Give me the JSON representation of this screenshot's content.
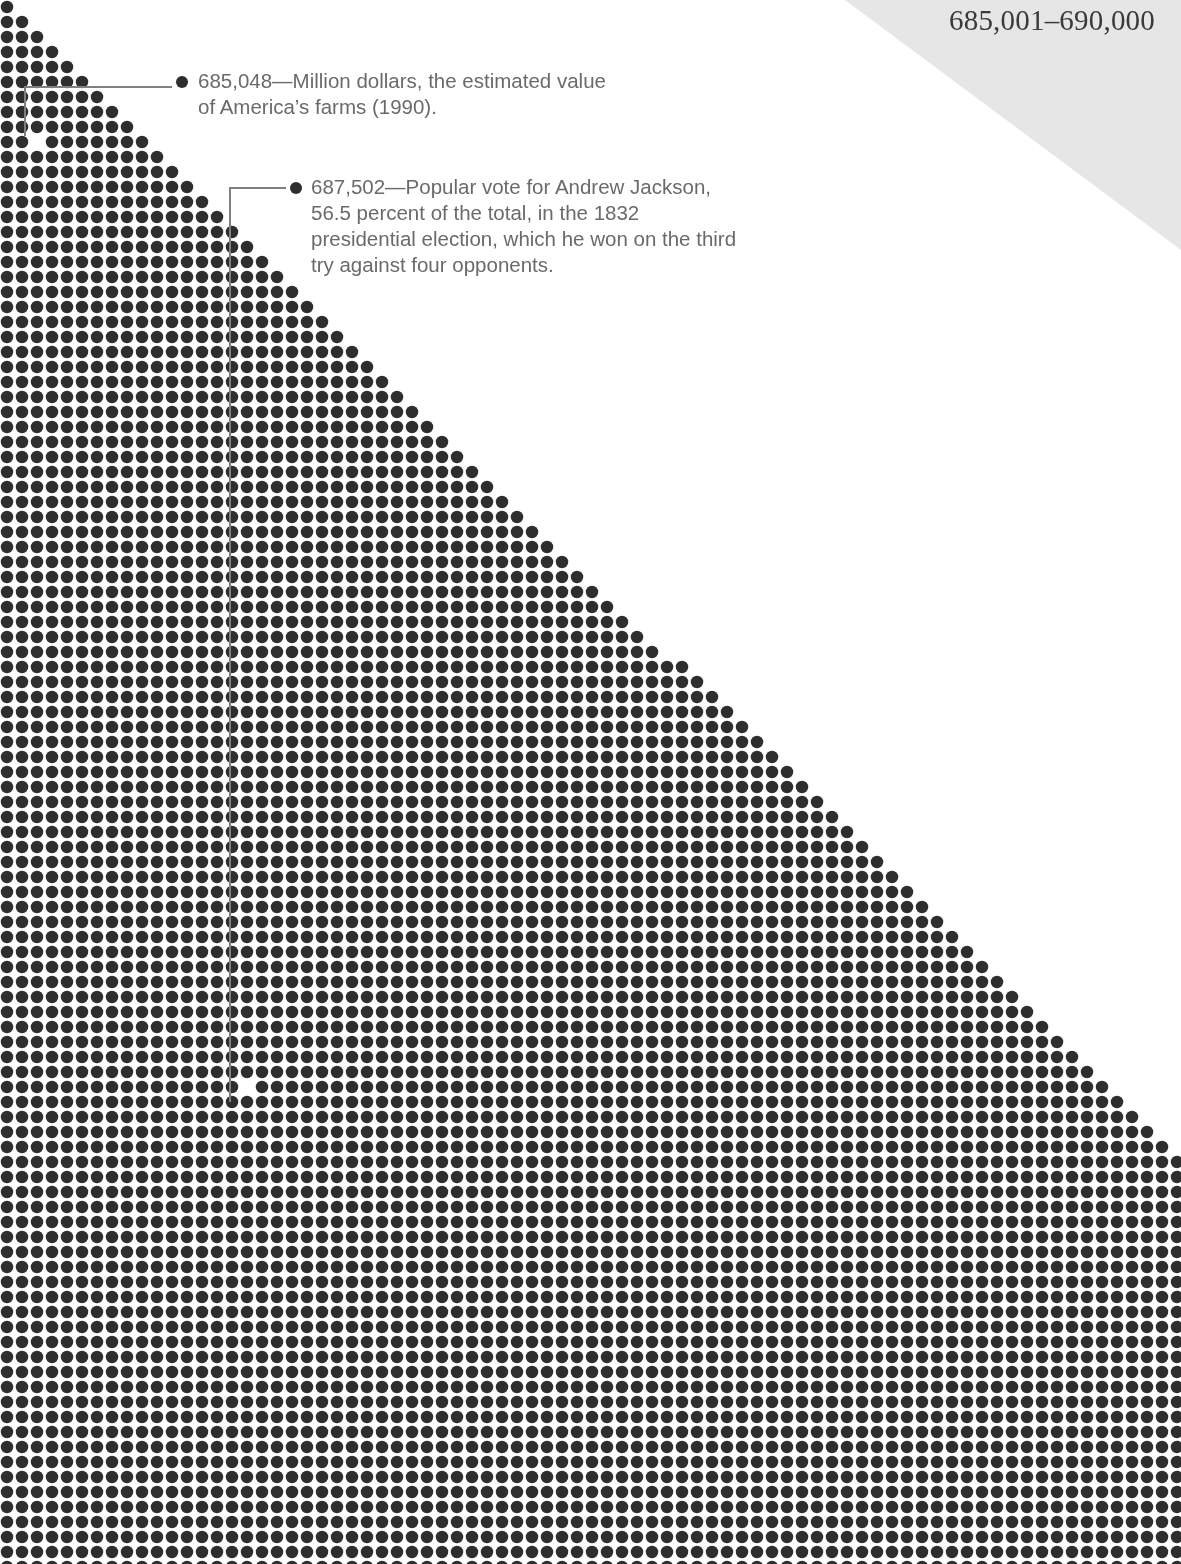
{
  "header": {
    "range_title": "685,001–690,000"
  },
  "colors": {
    "dot": "#2e2e2e",
    "background": "#ffffff",
    "corner_shade": "#e6e6e6",
    "annotation_text": "#6a6a6a",
    "leader_line": "#808080"
  },
  "annotations": [
    {
      "number": "685,048",
      "text": "685,048—Million dollars, the estimated value",
      "text_line2": "of America’s farms (1990).",
      "marker_x": 37,
      "marker_y": 145
    },
    {
      "number": "687,502",
      "line1": "687,502—Popular vote for Andrew Jackson,",
      "line2": "56.5 percent of the total, in the 1832",
      "line3": "presidential election, which he won on the third",
      "line4": "try against four opponents.",
      "marker_x": 247,
      "marker_y": 1083
    }
  ],
  "chart_data": {
    "type": "scatter",
    "title": "685,001–690,000",
    "range_start": 685001,
    "range_end": 690000,
    "dot_pitch_px": 15,
    "dot_diameter_px": 12.5,
    "highlights": [
      {
        "value": 685048,
        "label": "Million dollars, the estimated value of America’s farms (1990)."
      },
      {
        "value": 687502,
        "label": "Popular vote for Andrew Jackson, 56.5 percent of the total, in the 1832 presidential election, which he won on the third try against four opponents."
      }
    ],
    "xlabel": "",
    "ylabel": "",
    "grid": false,
    "legend": "none"
  }
}
